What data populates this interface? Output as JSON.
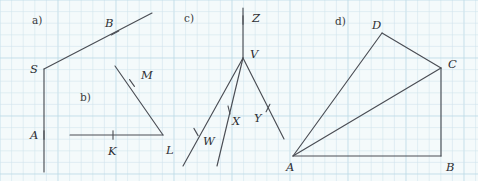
{
  "page": {
    "width": 478,
    "height": 181,
    "background_color": "#f4fafb",
    "grid_color": "#cfe4ec",
    "grid_major_color": "#bcdae6",
    "ink_color": "#4a4d54",
    "label_color": "#2d2f33",
    "grid_spacing_px": 11.6
  },
  "figures": [
    {
      "id": "a",
      "caption": "a)",
      "caption_pos": [
        32,
        15
      ],
      "points": [
        {
          "name": "S",
          "label": "S",
          "x": 44,
          "y": 69,
          "label_pos": [
            30,
            64
          ]
        },
        {
          "name": "B",
          "label": "B",
          "x": 115,
          "y": 33,
          "label_pos": [
            105,
            18
          ]
        },
        {
          "name": "A",
          "label": "A",
          "x": 44,
          "y": 135,
          "label_pos": [
            30,
            130
          ]
        }
      ],
      "segments": [
        {
          "name": "ray-S-up-right",
          "from": [
            44,
            69
          ],
          "to": [
            152,
            13
          ]
        },
        {
          "name": "ray-S-down",
          "from": [
            44,
            69
          ],
          "to": [
            44,
            172
          ]
        }
      ],
      "ticks": [
        {
          "name": "tick-B",
          "x": 115,
          "y": 33,
          "angle_deg": -27
        },
        {
          "name": "tick-A",
          "x": 44,
          "y": 135,
          "angle_deg": 90
        }
      ]
    },
    {
      "id": "b",
      "caption": "b)",
      "caption_pos": [
        80,
        92
      ],
      "points": [
        {
          "name": "M",
          "label": "M",
          "x": 132,
          "y": 83,
          "label_pos": [
            141,
            70
          ]
        },
        {
          "name": "K",
          "label": "K",
          "x": 113,
          "y": 135,
          "label_pos": [
            108,
            146
          ]
        },
        {
          "name": "L",
          "label": "L",
          "x": 163,
          "y": 135,
          "label_pos": [
            166,
            145
          ]
        }
      ],
      "segments": [
        {
          "name": "segment-K-horizontal",
          "from": [
            70,
            135
          ],
          "to": [
            163,
            135
          ]
        },
        {
          "name": "segment-M-to-L",
          "from": [
            115,
            66
          ],
          "to": [
            163,
            135
          ]
        }
      ],
      "ticks": [
        {
          "name": "tick-M",
          "x": 132,
          "y": 83,
          "angle_deg": 55
        },
        {
          "name": "tick-K",
          "x": 113,
          "y": 135,
          "angle_deg": 90
        }
      ]
    },
    {
      "id": "c",
      "caption": "c)",
      "caption_pos": [
        184,
        13
      ],
      "points": [
        {
          "name": "Z",
          "label": "Z",
          "x": 243,
          "y": 20,
          "label_pos": [
            252,
            13
          ]
        },
        {
          "name": "V",
          "label": "V",
          "x": 243,
          "y": 58,
          "label_pos": [
            250,
            49
          ]
        },
        {
          "name": "W",
          "label": "W",
          "x": 196,
          "y": 132,
          "label_pos": [
            203,
            136
          ]
        },
        {
          "name": "X",
          "label": "X",
          "x": 229,
          "y": 110,
          "label_pos": [
            232,
            116
          ]
        },
        {
          "name": "Y",
          "label": "Y",
          "x": 268,
          "y": 108,
          "label_pos": [
            254,
            113
          ]
        }
      ],
      "segments": [
        {
          "name": "ray-V-up-Z",
          "from": [
            243,
            58
          ],
          "to": [
            243,
            8
          ]
        },
        {
          "name": "ray-V-to-W",
          "from": [
            243,
            58
          ],
          "to": [
            183,
            166
          ]
        },
        {
          "name": "ray-V-to-X",
          "from": [
            243,
            58
          ],
          "to": [
            217,
            166
          ]
        },
        {
          "name": "ray-V-to-Y",
          "from": [
            243,
            58
          ],
          "to": [
            284,
            139
          ]
        }
      ],
      "ticks": [
        {
          "name": "tick-Z",
          "x": 243,
          "y": 20,
          "angle_deg": 90
        },
        {
          "name": "tick-W",
          "x": 196,
          "y": 132,
          "angle_deg": 60
        },
        {
          "name": "tick-X",
          "x": 229,
          "y": 110,
          "angle_deg": 76
        },
        {
          "name": "tick-Y",
          "x": 268,
          "y": 108,
          "angle_deg": 117
        }
      ]
    },
    {
      "id": "d",
      "caption": "d)",
      "caption_pos": [
        335,
        16
      ],
      "points": [
        {
          "name": "D",
          "label": "D",
          "x": 382,
          "y": 33,
          "label_pos": [
            372,
            20
          ]
        },
        {
          "name": "C",
          "label": "C",
          "x": 441,
          "y": 68,
          "label_pos": [
            448,
            59
          ]
        },
        {
          "name": "A",
          "label": "A",
          "x": 293,
          "y": 156,
          "label_pos": [
            286,
            162
          ]
        },
        {
          "name": "B",
          "label": "B",
          "x": 441,
          "y": 156,
          "label_pos": [
            446,
            162
          ]
        }
      ],
      "segments": [
        {
          "name": "segment-A-to-D",
          "from": [
            293,
            156
          ],
          "to": [
            382,
            33
          ]
        },
        {
          "name": "segment-D-to-C",
          "from": [
            382,
            33
          ],
          "to": [
            441,
            68
          ]
        },
        {
          "name": "segment-A-to-C",
          "from": [
            293,
            156
          ],
          "to": [
            441,
            68
          ]
        },
        {
          "name": "segment-C-to-B",
          "from": [
            441,
            68
          ],
          "to": [
            441,
            156
          ]
        },
        {
          "name": "segment-A-to-B",
          "from": [
            293,
            156
          ],
          "to": [
            441,
            156
          ]
        }
      ],
      "ticks": []
    }
  ]
}
